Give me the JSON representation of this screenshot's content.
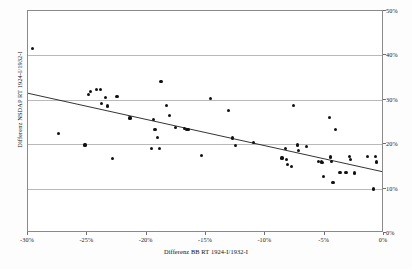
{
  "chart_data": {
    "type": "scatter",
    "title": "",
    "xlabel": "Differenz BB RT 1924-I/1932-I",
    "ylabel": "Differenz NSDAP RT 1924-I/1932-I",
    "xlim": [
      -30,
      0
    ],
    "ylim": [
      0,
      50
    ],
    "xticks": [
      -30,
      -25,
      -20,
      -15,
      -10,
      -5,
      0
    ],
    "xtick_labels": [
      "-30%",
      "-25%",
      "-20%",
      "-15%",
      "-10%",
      "-5%",
      "0%"
    ],
    "yticks": [
      0,
      10,
      20,
      30,
      40,
      50
    ],
    "ytick_labels": [
      "0%",
      "10%",
      "20%",
      "30%",
      "40%",
      "50%"
    ],
    "grid": "horizontal",
    "grid_color": "#b9b9b9",
    "legend": "none",
    "point_color": "#111111",
    "trendline_color": "#1a1a1a",
    "series": [
      {
        "name": "Wahlkreise",
        "points": [
          [
            -29.6,
            41.5
          ],
          [
            -27.4,
            22.4
          ],
          [
            -25.2,
            19.8
          ],
          [
            -24.9,
            31.2
          ],
          [
            -24.7,
            31.8
          ],
          [
            -24.2,
            32.4
          ],
          [
            -23.9,
            32.4
          ],
          [
            -23.8,
            29.1
          ],
          [
            -23.5,
            30.6
          ],
          [
            -23.3,
            28.6
          ],
          [
            -22.9,
            16.8
          ],
          [
            -22.5,
            30.7
          ],
          [
            -21.4,
            25.9
          ],
          [
            -19.6,
            19.1
          ],
          [
            -19.4,
            25.6
          ],
          [
            -19.3,
            23.4
          ],
          [
            -19.1,
            21.6
          ],
          [
            -18.9,
            19.1
          ],
          [
            -18.8,
            34.2
          ],
          [
            -18.3,
            28.8
          ],
          [
            -18.1,
            26.5
          ],
          [
            -17.6,
            23.7
          ],
          [
            -16.8,
            23.5
          ],
          [
            -16.6,
            23.3
          ],
          [
            -16.5,
            23.3
          ],
          [
            -15.4,
            17.5
          ],
          [
            -14.6,
            30.3
          ],
          [
            -13.1,
            27.6
          ],
          [
            -12.8,
            21.4
          ],
          [
            -12.5,
            19.7
          ],
          [
            -11.0,
            20.3
          ],
          [
            -8.6,
            16.9
          ],
          [
            -8.3,
            19.0
          ],
          [
            -8.2,
            16.5
          ],
          [
            -8.1,
            15.5
          ],
          [
            -7.8,
            15.0
          ],
          [
            -7.6,
            28.8
          ],
          [
            -7.3,
            19.8
          ],
          [
            -7.2,
            18.5
          ],
          [
            -6.5,
            19.5
          ],
          [
            -5.5,
            16.1
          ],
          [
            -5.3,
            16.0
          ],
          [
            -5.2,
            15.9
          ],
          [
            -5.1,
            12.7
          ],
          [
            -4.6,
            26.1
          ],
          [
            -4.5,
            17.1
          ],
          [
            -4.4,
            16.1
          ],
          [
            -4.3,
            11.4
          ],
          [
            -4.1,
            23.4
          ],
          [
            -3.7,
            13.6
          ],
          [
            -3.2,
            13.7
          ],
          [
            -2.9,
            17.3
          ],
          [
            -2.8,
            16.5
          ],
          [
            -2.5,
            13.5
          ],
          [
            -1.4,
            17.2
          ],
          [
            -0.9,
            9.9
          ],
          [
            -0.7,
            17.3
          ],
          [
            -0.6,
            16.0
          ]
        ]
      }
    ],
    "trendline": {
      "type": "linear",
      "x_start": -30,
      "y_start": 31.3,
      "x_end": 0,
      "y_end": 13.5
    }
  }
}
